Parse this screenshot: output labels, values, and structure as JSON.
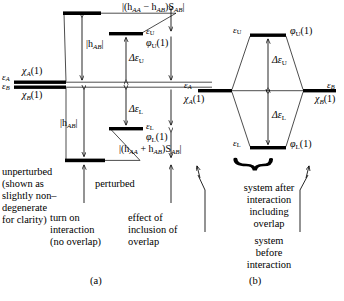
{
  "figure": {
    "type": "molecular-orbital-energy-level-diagram",
    "background": "#ffffff",
    "ink": "#000000",
    "panels": [
      {
        "id": "a",
        "label": "(a)"
      },
      {
        "id": "b",
        "label": "(b)"
      }
    ]
  },
  "panel_a": {
    "levels": {
      "unperturbed_A": {
        "label_energy": "ε",
        "label_energy_sub": "A",
        "orbital": "χ",
        "orbital_sub": "A",
        "orbital_arg": "(1)"
      },
      "unperturbed_B": {
        "label_energy": "ε",
        "label_energy_sub": "B",
        "orbital": "χ",
        "orbital_sub": "B",
        "orbital_arg": "(1)"
      },
      "upper_no_overlap": {
        "note": "level raised by |h_AB| with no overlap"
      },
      "lower_no_overlap": {
        "note": "level lowered by |h_AB| with no overlap"
      },
      "upper_final": {
        "energy": "ε",
        "energy_sub": "U",
        "orbital": "φ",
        "orbital_sub": "U",
        "orbital_arg": "(1)"
      },
      "lower_final": {
        "energy": "ε",
        "energy_sub": "L",
        "orbital": "φ",
        "orbital_sub": "L",
        "orbital_arg": "(1)"
      }
    },
    "annotations": {
      "h_upper": "|h",
      "h_upper_sub": "AB",
      "h_upper_tail": "|",
      "h_lower": "|h",
      "h_lower_sub": "AB",
      "h_lower_tail": "|",
      "delta_upper": "Δε",
      "delta_upper_sub": "U",
      "delta_lower": "Δε",
      "delta_lower_sub": "L",
      "overlap_upper_pre": "|(h",
      "overlap_upper_sub1": "AA",
      "overlap_upper_mid": " − h",
      "overlap_upper_sub2": "AB",
      "overlap_upper_post": ")S",
      "overlap_upper_sub3": "AB",
      "overlap_upper_end": "|",
      "overlap_lower_pre": "|(h",
      "overlap_lower_sub1": "AA",
      "overlap_lower_mid": " + h",
      "overlap_lower_sub2": "AB",
      "overlap_lower_post": ")S",
      "overlap_lower_sub3": "AB",
      "overlap_lower_end": "|"
    },
    "captions": {
      "unperturbed": [
        "unperturbed",
        "(shown as",
        "slightly non–",
        "degenerate",
        "for clarity)"
      ],
      "perturbed": "perturbed",
      "turn_on": [
        "turn on",
        "interaction",
        "(no overlap)"
      ],
      "effect_of": [
        "effect of",
        "inclusion of",
        "overlap"
      ]
    }
  },
  "panel_b": {
    "levels": {
      "left_atom": {
        "energy": "ε",
        "energy_sub": "A",
        "orbital": "χ",
        "orbital_sub": "A",
        "orbital_arg": "(1)"
      },
      "right_atom": {
        "energy": "ε",
        "energy_sub": "B",
        "orbital": "χ",
        "orbital_sub": "B",
        "orbital_arg": "(1)"
      },
      "upper_mo": {
        "energy": "ε",
        "energy_sub": "U",
        "orbital": "φ",
        "orbital_sub": "U",
        "orbital_arg": "(1)"
      },
      "lower_mo": {
        "energy": "ε",
        "energy_sub": "L",
        "orbital": "φ",
        "orbital_sub": "L",
        "orbital_arg": "(1)"
      }
    },
    "annotations": {
      "delta_upper": "Δε",
      "delta_upper_sub": "U",
      "delta_lower": "Δε",
      "delta_lower_sub": "L"
    },
    "captions": {
      "after": [
        "system after",
        "interaction",
        "including",
        "overlap"
      ],
      "before": [
        "system",
        "before",
        "interaction"
      ]
    }
  }
}
